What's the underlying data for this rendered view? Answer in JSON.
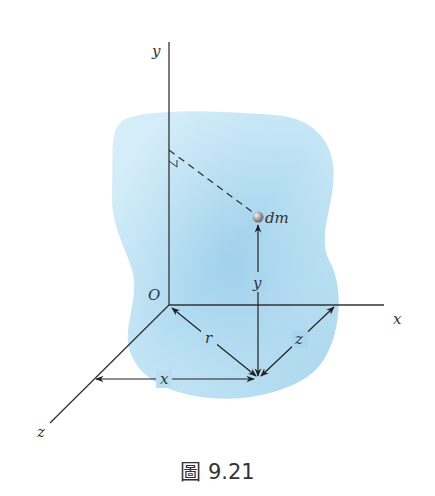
{
  "figure": {
    "labels": {
      "y_axis": "y",
      "x_axis": "x",
      "z_axis": "z",
      "origin": "O",
      "mass_element": "dm",
      "dim_y": "y",
      "dim_r": "r",
      "dim_z": "z",
      "dim_x": "x"
    },
    "colors": {
      "body_fill": "#b3ddf2",
      "body_shade": "#8ec6e6",
      "axis_stroke": "#333333",
      "sphere": "#9a9a9a"
    }
  },
  "caption": "圖 9.21"
}
